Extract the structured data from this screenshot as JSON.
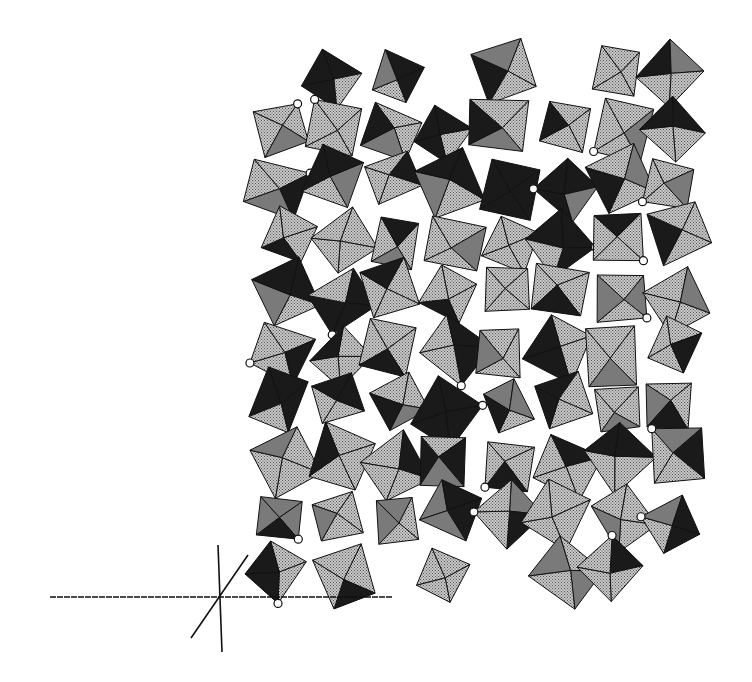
{
  "figure": {
    "type": "crystal-structure-polyhedral-projection",
    "colors": {
      "background": "#ffffff",
      "light_face": "#b8b8b8",
      "dark_face": "#1a1a1a",
      "mid_face": "#7a7a7a",
      "edge": "#111111",
      "atom": "#ffffff"
    },
    "structure_bounds": {
      "x": 255,
      "y": 45,
      "width": 445,
      "height": 555
    },
    "axes": {
      "horizontal": {
        "x1": 50,
        "y1": 597,
        "x2": 392,
        "y2": 597
      },
      "vertical": {
        "x1": 218,
        "y1": 545,
        "x2": 222,
        "y2": 652
      },
      "oblique": {
        "x1": 191,
        "y1": 638,
        "x2": 248,
        "y2": 555
      }
    }
  }
}
